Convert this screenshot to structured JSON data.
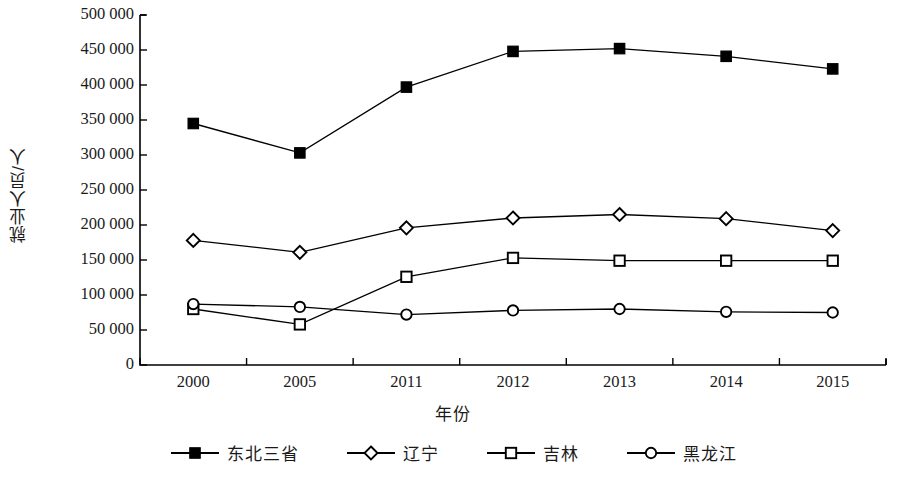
{
  "chart_data": {
    "type": "line",
    "title": "",
    "xlabel": "年份",
    "ylabel": "就业人员/人",
    "categories": [
      "2000",
      "2005",
      "2011",
      "2012",
      "2013",
      "2014",
      "2015"
    ],
    "ylim": [
      0,
      500000
    ],
    "ytick_values": [
      0,
      50000,
      100000,
      150000,
      200000,
      250000,
      300000,
      350000,
      400000,
      450000,
      500000
    ],
    "ytick_labels": [
      "0",
      "50 000",
      "100 000",
      "150 000",
      "200 000",
      "250 000",
      "300 000",
      "350 000",
      "400 000",
      "450 000",
      "500 000"
    ],
    "grid": false,
    "legend_position": "bottom",
    "series": [
      {
        "name": "东北三省",
        "marker": "filled-square",
        "color": "#000000",
        "values": [
          345000,
          303000,
          397000,
          448000,
          452000,
          441000,
          423000
        ]
      },
      {
        "name": "辽宁",
        "marker": "open-diamond",
        "color": "#000000",
        "values": [
          178000,
          161000,
          196000,
          210000,
          215000,
          209000,
          192000
        ]
      },
      {
        "name": "吉林",
        "marker": "open-square",
        "color": "#000000",
        "values": [
          80000,
          58000,
          126000,
          153000,
          149000,
          149000,
          149000
        ]
      },
      {
        "name": "黑龙江",
        "marker": "open-circle",
        "color": "#000000",
        "values": [
          87000,
          83000,
          72000,
          78000,
          80000,
          76000,
          75000
        ]
      }
    ]
  }
}
